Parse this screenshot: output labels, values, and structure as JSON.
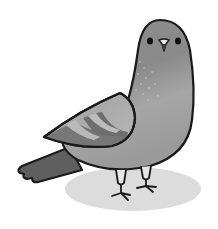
{
  "illustration": {
    "subject": "pigeon",
    "style": "cartoon grayscale",
    "colors": {
      "background": "#ffffff",
      "outline": "#1a1a1a",
      "body": "#8f8f8f",
      "body_light": "#b4b4b4",
      "wing": "#a8a8a8",
      "wing_stripe": "#6e6e6e",
      "wing_stripe_light": "#b9b9b9",
      "tail": "#5f5f5f",
      "shadow": "#dcdcdc",
      "beak": "#e8e8e8"
    }
  }
}
